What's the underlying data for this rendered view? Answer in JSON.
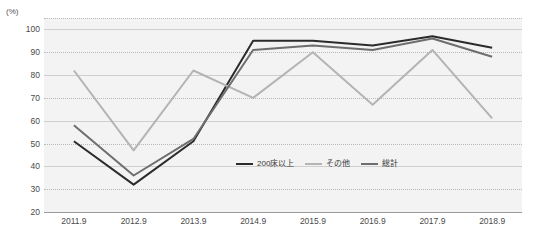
{
  "chart_data": {
    "type": "line",
    "title": "",
    "xlabel": "",
    "ylabel": "(%)",
    "unit_label": "(%)",
    "categories": [
      "2011.9",
      "2012.9",
      "2013.9",
      "2014.9",
      "2015.9",
      "2016.9",
      "2017.9",
      "2018.9"
    ],
    "ylim": [
      20,
      105
    ],
    "yticks": [
      20,
      30,
      40,
      50,
      60,
      70,
      80,
      90,
      100
    ],
    "grid": true,
    "legend_position": "inside-bottom-center",
    "series": [
      {
        "name": "200床以上",
        "color": "#2b2b2b",
        "values": [
          51,
          32,
          51,
          95,
          95,
          93,
          97,
          92
        ]
      },
      {
        "name": "その他",
        "color": "#b4b4b4",
        "values": [
          82,
          47,
          82,
          70,
          90,
          67,
          91,
          61
        ]
      },
      {
        "name": "総計",
        "color": "#6e6e6e",
        "values": [
          58,
          36,
          52,
          91,
          93,
          91,
          96,
          88
        ]
      }
    ]
  },
  "legend": {
    "items": [
      {
        "label": "200床以上",
        "color": "#2b2b2b"
      },
      {
        "label": "その他",
        "color": "#b4b4b4"
      },
      {
        "label": "総計",
        "color": "#6e6e6e"
      }
    ]
  },
  "colors": {
    "plot_background": "#f3f3f3",
    "gridline": "#b9b9b9",
    "axis": "#9a9a9a",
    "text": "#4a4a4a"
  }
}
